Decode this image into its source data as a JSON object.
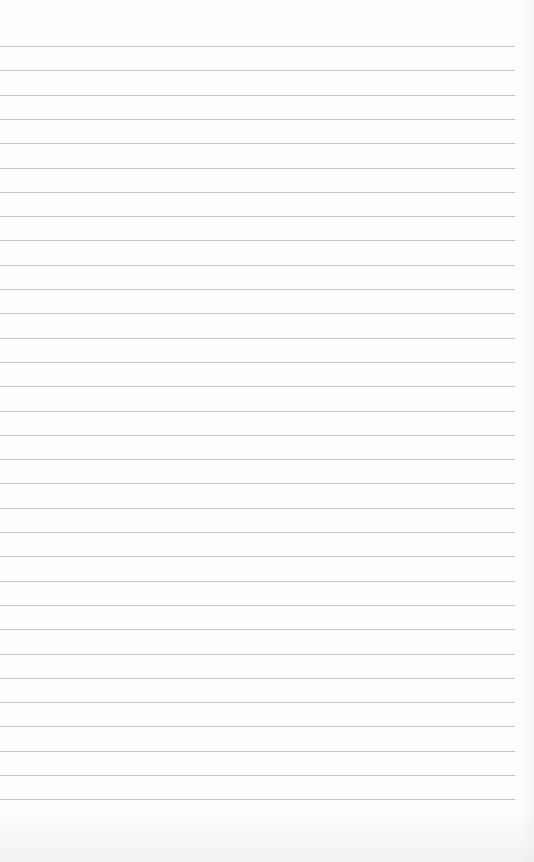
{
  "paper": {
    "type": "blank lined paper",
    "line_count": 32,
    "first_line_y": 46,
    "line_spacing": 24.3,
    "line_width": 515,
    "line_color": "#c4c4c4",
    "background_color": "#fefefe"
  }
}
